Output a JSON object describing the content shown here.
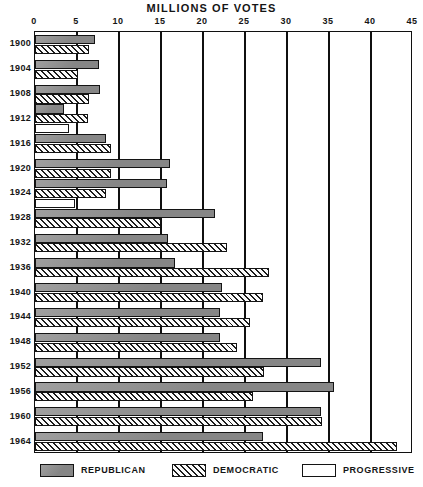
{
  "chart_data": {
    "type": "bar",
    "orientation": "horizontal",
    "title": "MILLIONS OF VOTES",
    "xlabel": "MILLIONS OF VOTES",
    "ylabel": "",
    "xlim": [
      0,
      45
    ],
    "xticks": [
      0,
      5,
      10,
      15,
      20,
      25,
      30,
      35,
      40,
      45
    ],
    "xtick_labels": [
      "0",
      "5",
      "10",
      "15",
      "20",
      "25",
      "30",
      "35",
      "40",
      "45"
    ],
    "grid": true,
    "grid_axis": "x",
    "legend_position": "below",
    "categories": [
      "1900",
      "1904",
      "1908",
      "1912",
      "1916",
      "1920",
      "1924",
      "1928",
      "1932",
      "1936",
      "1940",
      "1944",
      "1948",
      "1952",
      "1956",
      "1960",
      "1964"
    ],
    "series": [
      {
        "name": "REPUBLICAN",
        "fill": "solid-gray",
        "color": "#8d8d8d",
        "values": [
          7.2,
          7.6,
          7.7,
          3.5,
          8.5,
          16.1,
          15.7,
          21.4,
          15.8,
          16.7,
          22.3,
          22.0,
          22.0,
          34.0,
          35.6,
          34.1,
          27.2
        ]
      },
      {
        "name": "DEMOCRATIC",
        "fill": "diagonal-hatch",
        "color": "#ffffff",
        "values": [
          6.4,
          5.1,
          6.4,
          6.3,
          9.1,
          9.1,
          8.4,
          15.0,
          22.8,
          27.8,
          27.2,
          25.6,
          24.1,
          27.3,
          26.0,
          34.2,
          43.1
        ]
      },
      {
        "name": "PROGRESSIVE",
        "fill": "white-outline",
        "color": "#ffffff",
        "values": [
          0,
          0,
          0,
          4.1,
          0,
          0,
          4.8,
          0,
          0,
          0,
          0,
          0,
          0,
          0,
          0,
          0,
          0
        ]
      }
    ]
  },
  "legend": {
    "entries": [
      {
        "label": "REPUBLICAN",
        "swatch": "solid-gray"
      },
      {
        "label": "DEMOCRATIC",
        "swatch": "diagonal-hatch"
      },
      {
        "label": "PROGRESSIVE",
        "swatch": "white-outline"
      }
    ]
  },
  "colors": {
    "republican": "#8d8d8d",
    "democratic_hatch": "#1c1c1c",
    "progressive": "#ffffff",
    "axis": "#101010",
    "text": "#151515",
    "background": "#ffffff"
  }
}
